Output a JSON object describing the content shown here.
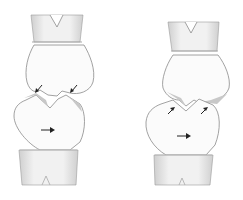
{
  "figure": {
    "panels": [
      {
        "id": "left",
        "upper_tooth_cusp_arrows": 2,
        "arrow_direction_cusps": "down-left / down-right (converging into lower tooth)",
        "body_arrow": "right"
      },
      {
        "id": "right",
        "lower_tooth_cusp_arrows": 2,
        "arrow_direction_cusps": "up-right (into upper tooth)",
        "body_arrow": "right"
      }
    ],
    "colors": {
      "background": "#ffffff",
      "outline": "#8a8a8a",
      "shading": "#c8c8c8",
      "arrow": "#222222"
    }
  }
}
